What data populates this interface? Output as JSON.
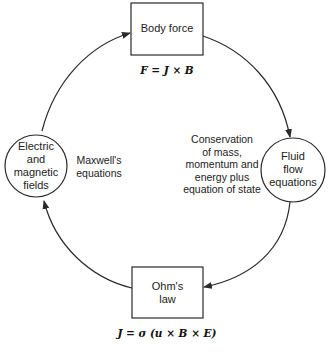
{
  "diagram": {
    "colors": {
      "stroke": "#2a2a2a",
      "text": "#222222",
      "background": "#ffffff"
    },
    "nodes": {
      "body_force": {
        "shape": "rectangle",
        "label": "Body force",
        "equation": "F = J × B"
      },
      "fluid_flow": {
        "shape": "circle",
        "lines": [
          "Fluid",
          "flow",
          "equations"
        ]
      },
      "ohms_law": {
        "shape": "rectangle",
        "lines": [
          "Ohm's",
          "law"
        ],
        "equation": "J = σ (u × B × E)"
      },
      "em_fields": {
        "shape": "circle",
        "lines": [
          "Electric",
          "and",
          "magnetic",
          "fields"
        ]
      }
    },
    "annotations": {
      "maxwell": [
        "Maxwell's",
        "equations"
      ],
      "conservation": [
        "Conservation",
        "of mass,",
        "momentum and",
        "energy plus",
        "equation of state"
      ]
    },
    "edges": [
      {
        "from": "em_fields",
        "to": "body_force"
      },
      {
        "from": "body_force",
        "to": "fluid_flow"
      },
      {
        "from": "fluid_flow",
        "to": "ohms_law"
      },
      {
        "from": "ohms_law",
        "to": "em_fields"
      }
    ]
  }
}
